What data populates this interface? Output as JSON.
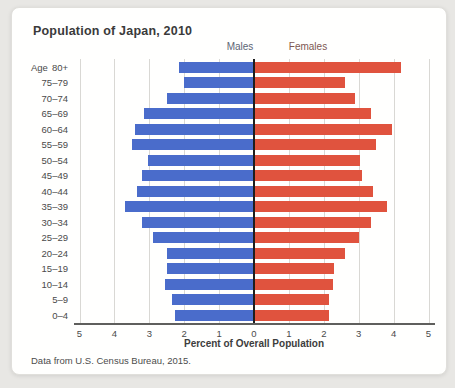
{
  "card": {
    "title": "Population of Japan, 2010",
    "source_note": "Data from U.S. Census Bureau, 2015."
  },
  "chart_data": {
    "type": "bar",
    "subtype": "population-pyramid",
    "title": "Population of Japan, 2010",
    "xlabel": "Percent of Overall Population",
    "age_axis_label": "Age",
    "left_series_label": "Males",
    "right_series_label": "Females",
    "categories_top_to_bottom": [
      "80+",
      "75–79",
      "70–74",
      "65–69",
      "60–64",
      "55–59",
      "50–54",
      "45–49",
      "40–44",
      "35–39",
      "30–34",
      "25–29",
      "20–24",
      "15–19",
      "10–14",
      "5–9",
      "0–4"
    ],
    "series": [
      {
        "name": "Males",
        "side": "left",
        "color": "#4a6ccb",
        "values": [
          2.15,
          2.0,
          2.5,
          3.15,
          3.4,
          3.5,
          3.05,
          3.2,
          3.35,
          3.7,
          3.2,
          2.9,
          2.5,
          2.5,
          2.55,
          2.35,
          2.25
        ]
      },
      {
        "name": "Females",
        "side": "right",
        "color": "#e0533e",
        "values": [
          4.2,
          2.6,
          2.9,
          3.35,
          3.95,
          3.5,
          3.05,
          3.1,
          3.4,
          3.8,
          3.35,
          3.0,
          2.6,
          2.3,
          2.25,
          2.15,
          2.15
        ]
      }
    ],
    "x_ticks": [
      "5",
      "4",
      "3",
      "2",
      "1",
      "0",
      "1",
      "2",
      "3",
      "4",
      "5"
    ],
    "xlim": [
      -5,
      5
    ],
    "grid": true,
    "colors": {
      "male_bar": "#4a6ccb",
      "female_bar": "#e0533e",
      "gridline": "#d9d8d4",
      "center_line": "#1e1e1e",
      "axis_line": "#5f5f5d"
    }
  }
}
